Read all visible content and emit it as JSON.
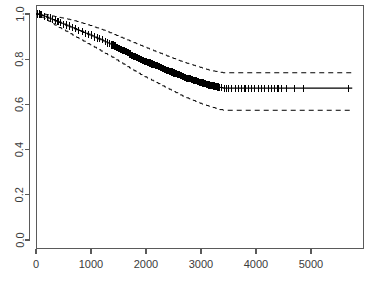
{
  "chart_data": {
    "type": "line",
    "title": "",
    "subtitle": "",
    "xlabel": "",
    "ylabel": "",
    "xlim": [
      0,
      5750
    ],
    "ylim": [
      0.0,
      1.0
    ],
    "grid": false,
    "legend": null,
    "x_ticks": [
      0,
      1000,
      2000,
      3000,
      4000,
      5000
    ],
    "x_tick_labels": [
      "0",
      "1000",
      "2000",
      "3000",
      "4000",
      "5000"
    ],
    "y_ticks": [
      0.0,
      0.2,
      0.4,
      0.6,
      0.8,
      1.0
    ],
    "y_tick_labels": [
      "0.0",
      "0.2",
      "0.4",
      "0.6",
      "0.8",
      "1.0"
    ],
    "series": [
      {
        "name": "survival-estimate",
        "style": "solid",
        "x": [
          0,
          40,
          75,
          110,
          150,
          190,
          230,
          270,
          300,
          340,
          380,
          420,
          460,
          500,
          540,
          580,
          620,
          660,
          700,
          740,
          780,
          820,
          860,
          900,
          940,
          980,
          1020,
          1060,
          1100,
          1140,
          1180,
          1220,
          1260,
          1300,
          1340,
          1380,
          1420,
          1460,
          1500,
          1540,
          1580,
          1620,
          1660,
          1700,
          1740,
          1780,
          1820,
          1860,
          1900,
          1940,
          1980,
          2020,
          2060,
          2100,
          2140,
          2180,
          2220,
          2260,
          2300,
          2340,
          2380,
          2420,
          2460,
          2500,
          2540,
          2580,
          2620,
          2660,
          2700,
          2740,
          2780,
          2820,
          2860,
          2900,
          2940,
          2980,
          3020,
          3060,
          3100,
          3140,
          3180,
          3220,
          3260,
          3300,
          3340,
          3400,
          5750
        ],
        "y": [
          1.0,
          1.0,
          0.997,
          0.994,
          0.99,
          0.986,
          0.982,
          0.978,
          0.975,
          0.971,
          0.967,
          0.963,
          0.959,
          0.955,
          0.951,
          0.947,
          0.943,
          0.939,
          0.935,
          0.931,
          0.927,
          0.923,
          0.919,
          0.915,
          0.911,
          0.907,
          0.903,
          0.898,
          0.894,
          0.89,
          0.886,
          0.881,
          0.877,
          0.872,
          0.868,
          0.863,
          0.858,
          0.853,
          0.848,
          0.843,
          0.838,
          0.833,
          0.828,
          0.823,
          0.818,
          0.813,
          0.808,
          0.803,
          0.799,
          0.795,
          0.791,
          0.787,
          0.783,
          0.779,
          0.775,
          0.771,
          0.767,
          0.763,
          0.759,
          0.755,
          0.751,
          0.747,
          0.743,
          0.739,
          0.735,
          0.731,
          0.727,
          0.723,
          0.72,
          0.716,
          0.713,
          0.71,
          0.707,
          0.704,
          0.701,
          0.698,
          0.695,
          0.692,
          0.689,
          0.686,
          0.683,
          0.681,
          0.679,
          0.677,
          0.675,
          0.672,
          0.672
        ]
      },
      {
        "name": "upper-confidence-band",
        "style": "dashed",
        "x": [
          0,
          40,
          75,
          110,
          150,
          190,
          230,
          270,
          300,
          340,
          380,
          420,
          460,
          500,
          540,
          580,
          620,
          660,
          700,
          740,
          780,
          820,
          860,
          900,
          940,
          980,
          1020,
          1060,
          1100,
          1140,
          1180,
          1220,
          1260,
          1300,
          1340,
          1380,
          1420,
          1460,
          1500,
          1540,
          1580,
          1620,
          1660,
          1700,
          1740,
          1780,
          1820,
          1860,
          1900,
          1940,
          1980,
          2020,
          2060,
          2100,
          2140,
          2180,
          2220,
          2260,
          2300,
          2340,
          2380,
          2420,
          2460,
          2500,
          2540,
          2580,
          2620,
          2660,
          2700,
          2740,
          2780,
          2820,
          2860,
          2900,
          2940,
          2980,
          3020,
          3060,
          3100,
          3140,
          3180,
          3220,
          3260,
          3300,
          3340,
          3400,
          5750
        ],
        "y": [
          1.0,
          1.0,
          1.0,
          1.0,
          0.999,
          0.997,
          0.995,
          0.993,
          0.991,
          0.989,
          0.987,
          0.985,
          0.983,
          0.981,
          0.979,
          0.977,
          0.975,
          0.972,
          0.97,
          0.967,
          0.964,
          0.961,
          0.958,
          0.955,
          0.952,
          0.949,
          0.946,
          0.942,
          0.939,
          0.936,
          0.932,
          0.929,
          0.925,
          0.921,
          0.917,
          0.913,
          0.909,
          0.905,
          0.901,
          0.897,
          0.893,
          0.889,
          0.885,
          0.881,
          0.877,
          0.873,
          0.869,
          0.865,
          0.861,
          0.857,
          0.853,
          0.849,
          0.845,
          0.841,
          0.837,
          0.833,
          0.829,
          0.826,
          0.822,
          0.818,
          0.814,
          0.81,
          0.806,
          0.803,
          0.799,
          0.795,
          0.792,
          0.788,
          0.785,
          0.782,
          0.779,
          0.776,
          0.773,
          0.77,
          0.767,
          0.764,
          0.761,
          0.758,
          0.755,
          0.752,
          0.75,
          0.748,
          0.746,
          0.744,
          0.742,
          0.74,
          0.74
        ]
      },
      {
        "name": "lower-confidence-band",
        "style": "dashed",
        "x": [
          0,
          40,
          75,
          110,
          150,
          190,
          230,
          270,
          300,
          340,
          380,
          420,
          460,
          500,
          540,
          580,
          620,
          660,
          700,
          740,
          780,
          820,
          860,
          900,
          940,
          980,
          1020,
          1060,
          1100,
          1140,
          1180,
          1220,
          1260,
          1300,
          1340,
          1380,
          1420,
          1460,
          1500,
          1540,
          1580,
          1620,
          1660,
          1700,
          1740,
          1780,
          1820,
          1860,
          1900,
          1940,
          1980,
          2020,
          2060,
          2100,
          2140,
          2180,
          2220,
          2260,
          2300,
          2340,
          2380,
          2420,
          2460,
          2500,
          2540,
          2580,
          2620,
          2660,
          2700,
          2740,
          2780,
          2820,
          2860,
          2900,
          2940,
          2980,
          3020,
          3060,
          3100,
          3140,
          3180,
          3220,
          3260,
          3300,
          3340,
          3400,
          5750
        ],
        "y": [
          1.0,
          0.998,
          0.992,
          0.986,
          0.98,
          0.974,
          0.968,
          0.962,
          0.957,
          0.951,
          0.946,
          0.94,
          0.935,
          0.929,
          0.924,
          0.918,
          0.913,
          0.907,
          0.902,
          0.896,
          0.891,
          0.885,
          0.88,
          0.874,
          0.869,
          0.864,
          0.858,
          0.853,
          0.847,
          0.842,
          0.836,
          0.831,
          0.825,
          0.82,
          0.814,
          0.809,
          0.803,
          0.797,
          0.791,
          0.785,
          0.779,
          0.773,
          0.767,
          0.761,
          0.755,
          0.749,
          0.743,
          0.738,
          0.732,
          0.727,
          0.722,
          0.717,
          0.712,
          0.707,
          0.702,
          0.697,
          0.692,
          0.687,
          0.682,
          0.677,
          0.672,
          0.667,
          0.662,
          0.657,
          0.652,
          0.647,
          0.642,
          0.637,
          0.633,
          0.629,
          0.625,
          0.621,
          0.617,
          0.613,
          0.609,
          0.605,
          0.601,
          0.598,
          0.595,
          0.592,
          0.589,
          0.586,
          0.583,
          0.58,
          0.577,
          0.574,
          0.574
        ]
      }
    ],
    "censored_points": {
      "name": "censoring-marks",
      "x": [
        30,
        55,
        70,
        85,
        100,
        160,
        210,
        255,
        300,
        350,
        400,
        450,
        500,
        560,
        610,
        660,
        720,
        780,
        840,
        900,
        960,
        1010,
        1060,
        1110,
        1160,
        1210,
        1260,
        1300,
        1340,
        1380,
        1400,
        1420,
        1440,
        1460,
        1480,
        1500,
        1520,
        1540,
        1560,
        1580,
        1600,
        1620,
        1640,
        1660,
        1680,
        1700,
        1720,
        1740,
        1760,
        1780,
        1800,
        1820,
        1840,
        1860,
        1880,
        1900,
        1920,
        1940,
        1960,
        1980,
        2000,
        2020,
        2040,
        2060,
        2080,
        2100,
        2120,
        2140,
        2160,
        2180,
        2200,
        2220,
        2240,
        2260,
        2280,
        2300,
        2320,
        2340,
        2360,
        2380,
        2400,
        2420,
        2440,
        2460,
        2480,
        2500,
        2520,
        2540,
        2560,
        2580,
        2600,
        2620,
        2640,
        2660,
        2680,
        2700,
        2720,
        2740,
        2760,
        2780,
        2800,
        2820,
        2840,
        2860,
        2880,
        2900,
        2920,
        2940,
        2960,
        2980,
        3000,
        3020,
        3040,
        3060,
        3080,
        3100,
        3120,
        3140,
        3160,
        3180,
        3200,
        3220,
        3240,
        3260,
        3280,
        3300,
        3320,
        3340,
        3380,
        3420,
        3460,
        3500,
        3560,
        3620,
        3680,
        3740,
        3800,
        3860,
        3920,
        3980,
        4040,
        4100,
        4160,
        4220,
        4280,
        4340,
        4400,
        4460,
        4560,
        4700,
        4860,
        5680
      ]
    }
  }
}
